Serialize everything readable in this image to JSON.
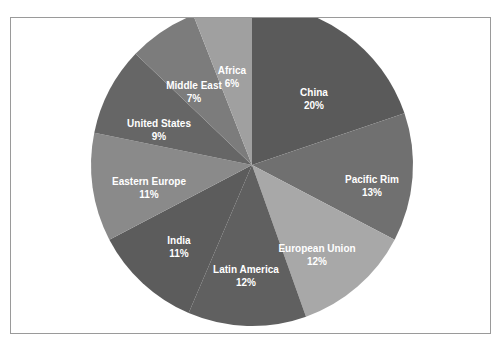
{
  "chart_data": {
    "type": "pie",
    "title": "",
    "categories": [
      "China",
      "Pacific Rim",
      "European Union",
      "Latin America",
      "India",
      "Eastern Europe",
      "United States",
      "Middle East",
      "Africa"
    ],
    "values": [
      20,
      13,
      12,
      12,
      11,
      11,
      9,
      7,
      6
    ],
    "labels": [
      "20%",
      "13%",
      "12%",
      "12%",
      "11%",
      "11%",
      "9%",
      "7%",
      "6%"
    ],
    "colors": [
      "#5a5a5a",
      "#707070",
      "#a8a8a8",
      "#606060",
      "#5c5c5c",
      "#8a8a8a",
      "#666666",
      "#7c7c7c",
      "#a0a0a0"
    ],
    "start_angle_deg": 0,
    "direction": "clockwise",
    "legend": "none",
    "label_position": "inside"
  },
  "slices": [
    {
      "name": "China",
      "pct": "20%"
    },
    {
      "name": "Pacific Rim",
      "pct": "13%"
    },
    {
      "name": "European Union",
      "pct": "12%"
    },
    {
      "name": "Latin America",
      "pct": "12%"
    },
    {
      "name": "India",
      "pct": "11%"
    },
    {
      "name": "Eastern Europe",
      "pct": "11%"
    },
    {
      "name": "United States",
      "pct": "9%"
    },
    {
      "name": "Middle East",
      "pct": "7%"
    },
    {
      "name": "Africa",
      "pct": "6%"
    }
  ]
}
